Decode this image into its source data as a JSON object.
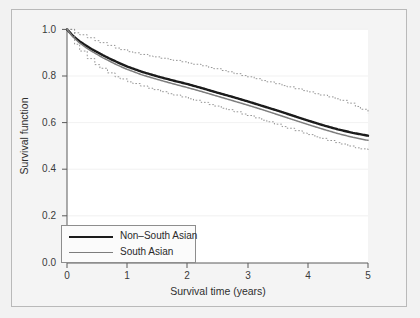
{
  "chart_data": {
    "type": "line",
    "title": "",
    "xlabel": "Survival time (years)",
    "ylabel": "Survival function",
    "xlim": [
      0,
      5
    ],
    "ylim": [
      0.0,
      1.0
    ],
    "xticks": [
      "0",
      "1",
      "2",
      "3",
      "4",
      "5"
    ],
    "yticks": [
      "0.0",
      "0.2",
      "0.4",
      "0.6",
      "0.8",
      "1.0"
    ],
    "grid": "horizontal-faint",
    "legend_position": "bottom-left",
    "x": [
      0,
      0.1,
      0.2,
      0.3,
      0.4,
      0.5,
      0.6,
      0.7,
      0.8,
      0.9,
      1.0,
      1.25,
      1.5,
      1.75,
      2.0,
      2.25,
      2.5,
      2.75,
      3.0,
      3.25,
      3.5,
      3.75,
      4.0,
      4.25,
      4.5,
      4.75,
      5.0
    ],
    "series": [
      {
        "name": "Non-South Asian",
        "label": "Non–South Asian",
        "color": "#1b1b1b",
        "width": 2.4,
        "style": "solid",
        "values": [
          1.0,
          0.972,
          0.951,
          0.933,
          0.917,
          0.903,
          0.889,
          0.876,
          0.864,
          0.852,
          0.841,
          0.818,
          0.799,
          0.782,
          0.766,
          0.748,
          0.729,
          0.711,
          0.692,
          0.672,
          0.652,
          0.631,
          0.61,
          0.59,
          0.572,
          0.557,
          0.545
        ]
      },
      {
        "name": "South Asian",
        "label": "South Asian",
        "color": "#7d7d7d",
        "width": 1.5,
        "style": "solid",
        "values": [
          1.0,
          0.968,
          0.944,
          0.925,
          0.908,
          0.893,
          0.878,
          0.865,
          0.852,
          0.84,
          0.829,
          0.805,
          0.786,
          0.768,
          0.751,
          0.733,
          0.714,
          0.695,
          0.676,
          0.656,
          0.635,
          0.614,
          0.593,
          0.573,
          0.554,
          0.538,
          0.525
        ]
      },
      {
        "name": "South Asian upper 95% CI",
        "label": "",
        "color": "#8a8a8a",
        "width": 0.9,
        "style": "dotted-step",
        "values": [
          1.0,
          0.988,
          0.978,
          0.968,
          0.958,
          0.948,
          0.938,
          0.929,
          0.92,
          0.912,
          0.905,
          0.891,
          0.879,
          0.868,
          0.856,
          0.843,
          0.828,
          0.812,
          0.796,
          0.78,
          0.764,
          0.748,
          0.732,
          0.716,
          0.7,
          0.676,
          0.64
        ]
      },
      {
        "name": "South Asian lower 95% CI",
        "label": "",
        "color": "#8a8a8a",
        "width": 0.9,
        "style": "dotted-step",
        "values": [
          1.0,
          0.946,
          0.91,
          0.883,
          0.861,
          0.842,
          0.824,
          0.81,
          0.797,
          0.786,
          0.776,
          0.755,
          0.737,
          0.72,
          0.704,
          0.686,
          0.667,
          0.649,
          0.63,
          0.61,
          0.59,
          0.569,
          0.549,
          0.53,
          0.512,
          0.495,
          0.482
        ]
      }
    ],
    "annotations": []
  },
  "axes": {
    "y_label": "Survival function",
    "x_label": "Survival time (years)",
    "y_tick_labels": [
      "1.0",
      "0.8",
      "0.6",
      "0.4",
      "0.2",
      "0.0"
    ],
    "x_tick_labels": [
      "0",
      "1",
      "2",
      "3",
      "4",
      "5"
    ]
  },
  "legend": {
    "entries": [
      {
        "label": "Non–South Asian",
        "style": "thick"
      },
      {
        "label": "South Asian",
        "style": "thin"
      }
    ]
  }
}
